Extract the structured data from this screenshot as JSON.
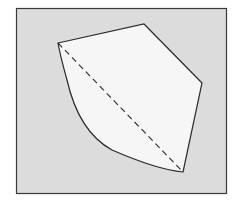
{
  "diagram": {
    "type": "geometric-figure",
    "colors": {
      "page_background": "#ffffff",
      "panel_fill": "#dcdcdc",
      "panel_stroke": "#3a3a3a",
      "shape_fill": "#f6f6f6",
      "shape_stroke": "#2a2a2a",
      "diagonal_stroke": "#2a2a2a"
    },
    "panel": {
      "x": 16,
      "y": 8,
      "width": 210,
      "height": 185
    },
    "vertices": {
      "left": [
        58,
        43
      ],
      "top": [
        144,
        24
      ],
      "right": [
        202,
        83
      ],
      "bottom": [
        183,
        172
      ]
    },
    "edges": {
      "left_to_top": "straight",
      "top_to_right": "straight",
      "right_to_bottom": "straight",
      "bottom_to_left": "curved",
      "diagonal_left_to_bottom": "dashed"
    }
  }
}
